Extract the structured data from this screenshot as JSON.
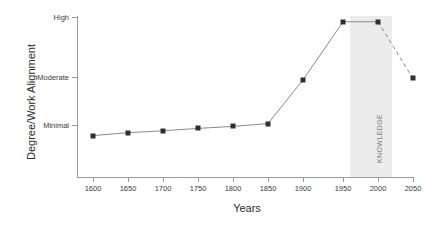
{
  "chart_data": {
    "type": "line",
    "title": "",
    "xlabel": "Years",
    "ylabel": "Degree/Work Alignment",
    "x": [
      1600,
      1650,
      1700,
      1750,
      1800,
      1850,
      1900,
      1950,
      2000,
      2050
    ],
    "xtick_labels": [
      "1600",
      "1650",
      "1700",
      "1750",
      "1800",
      "1850",
      "1900",
      "1950",
      "2000",
      "2050"
    ],
    "ytick_labels": [
      "High",
      "Moderate",
      "Minimal"
    ],
    "ytick_values": [
      3,
      2,
      1
    ],
    "values": [
      0.78,
      0.84,
      0.88,
      0.93,
      0.97,
      1.03,
      1.94,
      2.92,
      2.92,
      1.97
    ],
    "ylim": [
      0,
      3.2
    ],
    "xlim": [
      1575,
      2075
    ],
    "grid": false,
    "legend": null,
    "marker": "square",
    "marker_color": "#2f2f2f",
    "line_color": "#8a8a8a",
    "dashed_segment": {
      "from": 2000,
      "to": 2050,
      "note": "projected decline"
    },
    "annotations": [
      {
        "label": "KNOWLEDGE",
        "type": "shaded-band",
        "x_start": 1960,
        "x_end": 2020,
        "color": "#ececec",
        "orientation": "vertical-text"
      }
    ]
  },
  "axis": {
    "y_title": "Degree/Work Alignment",
    "x_title": "Years"
  }
}
